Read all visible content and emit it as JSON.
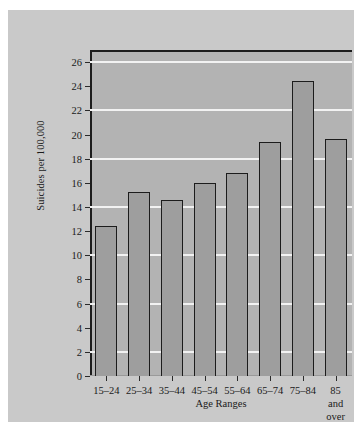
{
  "chart_data": {
    "type": "bar",
    "title": "",
    "subtitle": "",
    "xlabel": "Age Ranges",
    "ylabel": "Suicides per 100,000",
    "categories": [
      "15–24",
      "25–34",
      "35–44",
      "45–54",
      "55–64",
      "65–74",
      "75–84",
      "85 and\nover"
    ],
    "values": [
      12.4,
      15.2,
      14.6,
      16.0,
      16.8,
      19.4,
      24.4,
      19.6
    ],
    "ylim": [
      0,
      27
    ],
    "ytick_values": [
      0,
      2,
      4,
      6,
      8,
      10,
      12,
      14,
      16,
      18,
      20,
      22,
      24,
      26
    ],
    "ytick_labels": [
      "0",
      "2",
      "4",
      "6",
      "8",
      "10",
      "12",
      "14",
      "16",
      "18",
      "20",
      "22",
      "24",
      "26"
    ],
    "gridline_values": [
      2,
      6,
      10,
      14,
      18,
      22,
      26
    ],
    "grid": true,
    "legend": false,
    "legend_position": "none",
    "bar_fill_color": "#9e9e9e",
    "bar_edge_color": "#1c1c1c",
    "plot_background_color": "#b3b3b3",
    "figure_background_color": "#c9c9c9",
    "gridline_color": "#f2f2f2",
    "axis_color": "#1c1c1c"
  }
}
